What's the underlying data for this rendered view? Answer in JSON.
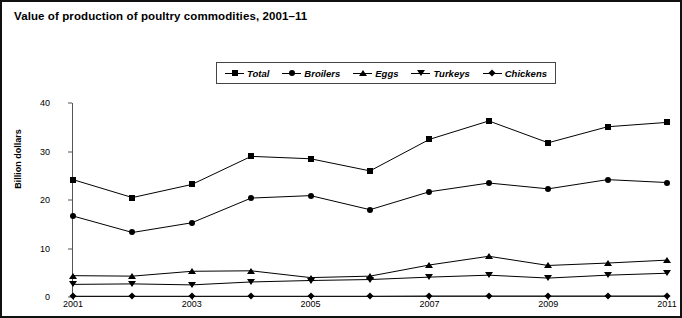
{
  "chart": {
    "title": "Value of production of poultry commodities, 2001–11",
    "ylabel": "Billion dollars"
  },
  "legend": {
    "items": [
      {
        "label": "Total",
        "marker": "square-marker-icon"
      },
      {
        "label": "Broilers",
        "marker": "circle-marker-icon"
      },
      {
        "label": "Eggs",
        "marker": "triangle-up-marker-icon"
      },
      {
        "label": "Turkeys",
        "marker": "triangle-down-marker-icon"
      },
      {
        "label": "Chickens",
        "marker": "diamond-marker-icon"
      }
    ]
  },
  "axes": {
    "y_ticks": [
      "0",
      "10",
      "20",
      "30",
      "40"
    ],
    "x_ticks": [
      "2001",
      "2003",
      "2005",
      "2007",
      "2009",
      "2011"
    ]
  },
  "chart_data": {
    "type": "line",
    "title": "Value of production of poultry commodities, 2001–11",
    "xlabel": "",
    "ylabel": "Billion dollars",
    "x": [
      2001,
      2002,
      2003,
      2004,
      2005,
      2006,
      2007,
      2008,
      2009,
      2010,
      2011
    ],
    "xlim": [
      2001,
      2011
    ],
    "ylim": [
      0,
      40
    ],
    "yticks": [
      0,
      10,
      20,
      30,
      40
    ],
    "xticks": [
      2001,
      2003,
      2005,
      2007,
      2009,
      2011
    ],
    "grid": false,
    "legend_position": "top-center",
    "series": [
      {
        "name": "Total",
        "marker": "square",
        "values": [
          24.2,
          20.5,
          23.2,
          29.0,
          28.5,
          26.0,
          32.5,
          36.3,
          31.8,
          35.1,
          36.0
        ]
      },
      {
        "name": "Broilers",
        "marker": "circle",
        "values": [
          16.7,
          13.3,
          15.3,
          20.4,
          20.9,
          18.0,
          21.7,
          23.5,
          22.3,
          24.2,
          23.6
        ]
      },
      {
        "name": "Eggs",
        "marker": "triangle_up",
        "values": [
          4.4,
          4.3,
          5.3,
          5.4,
          4.0,
          4.3,
          6.6,
          8.4,
          6.5,
          7.0,
          7.6
        ]
      },
      {
        "name": "Turkeys",
        "marker": "triangle_down",
        "values": [
          2.6,
          2.7,
          2.5,
          3.1,
          3.4,
          3.6,
          4.1,
          4.5,
          3.9,
          4.5,
          4.9
        ]
      },
      {
        "name": "Chickens",
        "marker": "diamond",
        "values": [
          0.15,
          0.15,
          0.15,
          0.15,
          0.15,
          0.15,
          0.2,
          0.2,
          0.2,
          0.2,
          0.2
        ]
      }
    ]
  }
}
